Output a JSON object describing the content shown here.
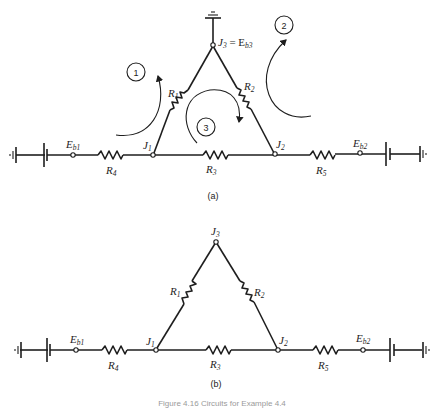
{
  "figure": {
    "caption": "Figure 4.16 Circuits for Example 4.4",
    "panels": [
      {
        "id": "a",
        "label": "(a)",
        "nodes": {
          "j1": {
            "name": "J",
            "sub": "1"
          },
          "j2": {
            "name": "J",
            "sub": "2"
          },
          "j3": {
            "name": "J",
            "sub": "3",
            "eq": " = E",
            "eq_sub": "b3"
          },
          "eb1": {
            "name": "E",
            "sub": "b1"
          },
          "eb2": {
            "name": "E",
            "sub": "b2"
          }
        },
        "resistors": {
          "r1": {
            "name": "R",
            "sub": "1"
          },
          "r2": {
            "name": "R",
            "sub": "2"
          },
          "r3": {
            "name": "R",
            "sub": "3"
          },
          "r4": {
            "name": "R",
            "sub": "4"
          },
          "r5": {
            "name": "R",
            "sub": "5"
          }
        },
        "loops": [
          "1",
          "2",
          "3"
        ]
      },
      {
        "id": "b",
        "label": "(b)",
        "nodes": {
          "j1": {
            "name": "J",
            "sub": "1"
          },
          "j2": {
            "name": "J",
            "sub": "2"
          },
          "j3": {
            "name": "J",
            "sub": "3"
          },
          "eb1": {
            "name": "E",
            "sub": "b1"
          },
          "eb2": {
            "name": "E",
            "sub": "b2"
          }
        },
        "resistors": {
          "r1": {
            "name": "R",
            "sub": "1"
          },
          "r2": {
            "name": "R",
            "sub": "2"
          },
          "r3": {
            "name": "R",
            "sub": "3"
          },
          "r4": {
            "name": "R",
            "sub": "4"
          },
          "r5": {
            "name": "R",
            "sub": "5"
          }
        }
      }
    ]
  }
}
